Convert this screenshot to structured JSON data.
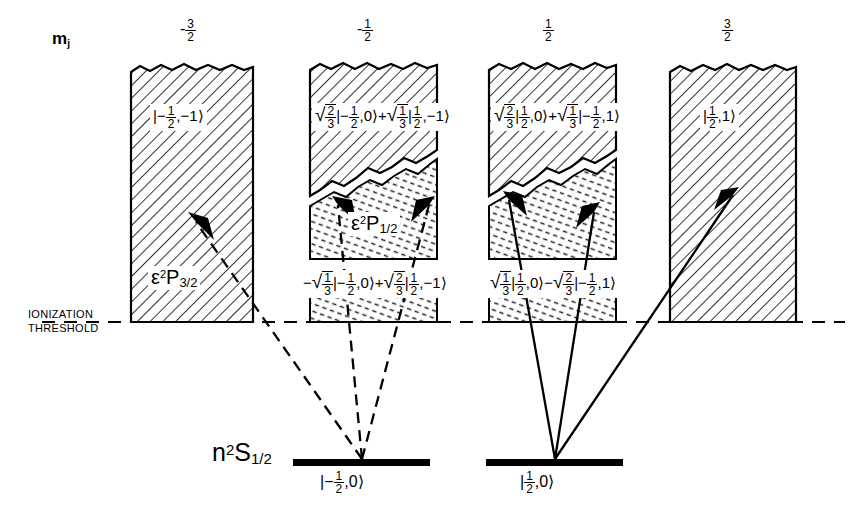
{
  "figure": {
    "type": "energy-level-diagram",
    "axis_label": "m",
    "axis_label_sub": "j",
    "threshold_label_line1": "IONIZATION",
    "threshold_label_line2": "THRESHOLD",
    "ground_term": {
      "n": "n",
      "multiplicity": "2",
      "term": "S",
      "j": "1/2"
    },
    "continuum_terms": {
      "p32": {
        "epsilon": "ε",
        "multiplicity": "2",
        "term": "P",
        "j": "3/2"
      },
      "p12": {
        "epsilon": "ε",
        "multiplicity": "2",
        "term": "P",
        "j": "1/2"
      }
    }
  },
  "columns": [
    {
      "id": "col-mj-minus-3-2",
      "mj_sign": "-",
      "mj_num": "3",
      "mj_den": "2",
      "upper_state": "|-½,-1⟩",
      "upper_state_parts": {
        "coef1": "",
        "ket1": "|-½,-1⟩",
        "op": "",
        "coef2": "",
        "ket2": ""
      },
      "lower_state": "",
      "term_label": "ε²P3/2",
      "has_split": false,
      "arrow_style": "dashed",
      "arrow_origin": "ground-minus",
      "arrows": 1
    },
    {
      "id": "col-mj-minus-1-2",
      "mj_sign": "-",
      "mj_num": "1",
      "mj_den": "2",
      "upper_state": "√(2/3)|-½,0⟩ + √(1/3)|½,-1⟩",
      "upper_state_parts": {
        "coef1num": "2",
        "coef1den": "3",
        "ket1": "|-½,0⟩",
        "op": "+",
        "coef2num": "1",
        "coef2den": "3",
        "ket2": "|½,-1⟩"
      },
      "lower_state": "-√(1/3)|-½,0⟩ + √(2/3)|½,-1⟩",
      "lower_state_parts": {
        "sign": "-",
        "coef1num": "1",
        "coef1den": "3",
        "ket1": "|-½,0⟩",
        "op": "+",
        "coef2num": "2",
        "coef2den": "3",
        "ket2": "|½,-1⟩"
      },
      "term_label": "ε²P1/2",
      "has_split": true,
      "arrow_style": "dashed",
      "arrow_origin": "ground-minus",
      "arrows": 2
    },
    {
      "id": "col-mj-plus-1-2",
      "mj_sign": "",
      "mj_num": "1",
      "mj_den": "2",
      "upper_state": "√(2/3)|½,0⟩ + √(1/3)|-½,1⟩",
      "upper_state_parts": {
        "coef1num": "2",
        "coef1den": "3",
        "ket1": "|½,0⟩",
        "op": "+",
        "coef2num": "1",
        "coef2den": "3",
        "ket2": "|-½,1⟩"
      },
      "lower_state": "√(1/3)|½,0⟩ - √(2/3)|-½,1⟩",
      "lower_state_parts": {
        "sign": "",
        "coef1num": "1",
        "coef1den": "3",
        "ket1": "|½,0⟩",
        "op": "−",
        "coef2num": "2",
        "coef2den": "3",
        "ket2": "|-½,1⟩"
      },
      "term_label": "",
      "has_split": true,
      "arrow_style": "solid",
      "arrow_origin": "ground-plus",
      "arrows": 2
    },
    {
      "id": "col-mj-plus-3-2",
      "mj_sign": "",
      "mj_num": "3",
      "mj_den": "2",
      "upper_state": "|½,1⟩",
      "upper_state_parts": {
        "coef1": "",
        "ket1": "|½,1⟩",
        "op": "",
        "coef2": "",
        "ket2": ""
      },
      "lower_state": "",
      "term_label": "",
      "has_split": false,
      "arrow_style": "solid",
      "arrow_origin": "ground-plus",
      "arrows": 1
    }
  ],
  "ground_levels": [
    {
      "id": "ground-minus",
      "ket": "|-½,0⟩",
      "ket_sign": "-",
      "ket_num": "1",
      "ket_den": "2",
      "ket_m": "0"
    },
    {
      "id": "ground-plus",
      "ket": "|½,0⟩",
      "ket_sign": "",
      "ket_num": "1",
      "ket_den": "2",
      "ket_m": "0"
    }
  ],
  "colors": {
    "ink": "#000000",
    "paper": "#ffffff",
    "hatch": "#111111",
    "dots": "#333333"
  }
}
